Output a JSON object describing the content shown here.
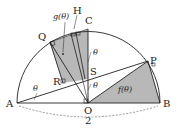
{
  "diagram": {
    "type": "geometry",
    "points": {
      "A": "A",
      "B": "B",
      "O": "O",
      "C": "C",
      "P": "P",
      "Q": "Q",
      "R": "R",
      "S": "S",
      "H": "H"
    },
    "labels": {
      "f": "f(θ)",
      "g": "g(θ)",
      "theta": "θ",
      "diameter_length": "2"
    },
    "colors": {
      "shade": "#b8b8b8",
      "stroke": "#222222",
      "background": "#ffffff"
    }
  }
}
